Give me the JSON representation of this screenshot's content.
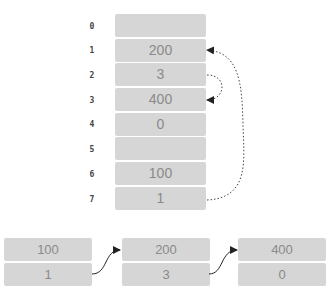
{
  "memory": {
    "cells": [
      {
        "index": "0",
        "value": ""
      },
      {
        "index": "1",
        "value": "200"
      },
      {
        "index": "2",
        "value": "3"
      },
      {
        "index": "3",
        "value": "400"
      },
      {
        "index": "4",
        "value": "0"
      },
      {
        "index": "5",
        "value": ""
      },
      {
        "index": "6",
        "value": "100"
      },
      {
        "index": "7",
        "value": "1"
      }
    ],
    "pointers": [
      {
        "from_index": "7",
        "to_index": "1"
      },
      {
        "from_index": "2",
        "to_index": "3"
      }
    ]
  },
  "linked_list": {
    "nodes": [
      {
        "value": "100",
        "next": "1"
      },
      {
        "value": "200",
        "next": "3"
      },
      {
        "value": "400",
        "next": "0"
      }
    ]
  },
  "colors": {
    "cell_fill": "#d6d6d6",
    "cell_text": "#8a8a8a",
    "index_text": "#444444",
    "arrow": "#333333"
  }
}
